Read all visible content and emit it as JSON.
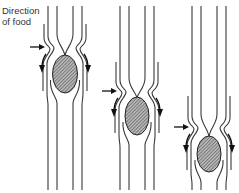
{
  "label": {
    "line1": "Direction",
    "line2": "of food"
  },
  "colors": {
    "wall": "#3a3a3a",
    "bolus_fill": "#9a9a9a",
    "arrow": "#111111",
    "background": "#ffffff"
  },
  "stages": [
    {
      "id": 1,
      "cx": 65,
      "constriction_y": 48,
      "outer_start_y": 24,
      "bolus": {
        "cy": 74,
        "rx": 12.5,
        "ry": 19
      }
    },
    {
      "id": 2,
      "cx": 137,
      "constriction_y": 92,
      "outer_start_y": 62,
      "bolus": {
        "cy": 116,
        "rx": 12,
        "ry": 19
      }
    },
    {
      "id": 3,
      "cx": 209,
      "constriction_y": 128,
      "outer_start_y": 96,
      "bolus": {
        "cy": 154,
        "rx": 12,
        "ry": 18
      }
    }
  ]
}
